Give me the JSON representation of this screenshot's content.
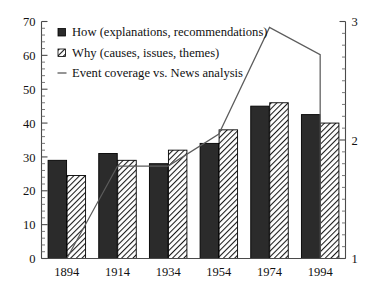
{
  "chart_data": {
    "type": "bar",
    "title": "",
    "subtitle": "",
    "xlabel": "",
    "ylabel": "",
    "categories": [
      "1894",
      "1914",
      "1934",
      "1954",
      "1974",
      "1994"
    ],
    "series": [
      {
        "name": "How (explanations, recommendations)",
        "type": "bar",
        "axis": "left",
        "marker": "filled-square",
        "values": [
          29,
          31,
          28,
          34,
          45,
          42.5
        ]
      },
      {
        "name": "Why (causes, issues, themes)",
        "type": "bar",
        "axis": "left",
        "marker": "hatched-square",
        "values": [
          24.5,
          29,
          32,
          38,
          46,
          40
        ]
      },
      {
        "name": "Event coverage vs. News analysis",
        "type": "line",
        "axis": "right",
        "marker": "line",
        "values": [
          1.0,
          1.78,
          1.78,
          2.05,
          2.95,
          2.72
        ]
      }
    ],
    "left_axis": {
      "min": 0,
      "max": 70,
      "major_ticks": [
        0,
        10,
        20,
        30,
        40,
        50,
        60,
        70
      ],
      "tick_labels": [
        "0",
        "10",
        "20",
        "30",
        "40",
        "50",
        "60",
        "70"
      ],
      "minor_step": 2
    },
    "right_axis": {
      "min": 1,
      "max": 3,
      "major_ticks": [
        1,
        2,
        3
      ],
      "tick_labels": [
        "1",
        "2",
        "3"
      ],
      "minor_step": 0.1
    },
    "grid": false,
    "legend": {
      "position": "top-left",
      "entries": [
        {
          "label": "How (explanations, recommendations)",
          "marker": "filled-square"
        },
        {
          "label": "Why (causes, issues, themes)",
          "marker": "hatched-square"
        },
        {
          "label": "Event coverage vs. News analysis",
          "marker": "line"
        }
      ]
    },
    "colors": {
      "bar_how": "#2b2b2b",
      "bar_why_fill": "#ffffff",
      "bar_why_hatch": "#1a1a1a",
      "line": "#5c5c5c",
      "axis": "#4a4a4a",
      "background": "#ffffff",
      "text": "#111111"
    }
  }
}
